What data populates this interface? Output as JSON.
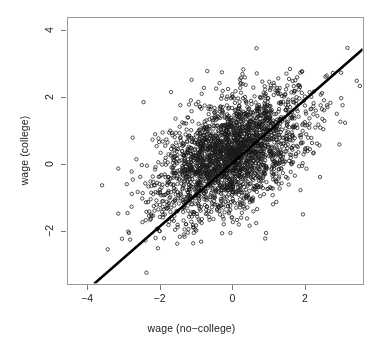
{
  "chart_data": {
    "type": "scatter",
    "title": "",
    "xlabel": "wage (no−college)",
    "ylabel": "wage (college)",
    "xlim": [
      -4.55,
      3.6
    ],
    "ylim": [
      -3.6,
      4.4
    ],
    "xticks": [
      -4,
      -2,
      0,
      2
    ],
    "xtick_labels": [
      "−4",
      "−2",
      "0",
      "2"
    ],
    "yticks": [
      -2,
      0,
      2,
      4
    ],
    "ytick_labels": [
      "−2",
      "0",
      "2",
      "4"
    ],
    "grid": false,
    "legend": null,
    "point_marker": "open-circle",
    "point_color": "#1a1a1a",
    "point_radius_px": 1.7,
    "n_points": 2500,
    "distribution": {
      "kind": "bivariate-normal",
      "mean_x": -0.05,
      "mean_y": 0.3,
      "sd_x": 1.02,
      "sd_y": 0.95,
      "correlation": 0.5
    },
    "reference_line": {
      "kind": "identity-line",
      "slope": 0.95,
      "intercept": 0.02,
      "x_start": -3.8,
      "x_end": 3.6,
      "color": "#000000",
      "width_px": 2.6
    },
    "box_color": "#9a9a9a",
    "tick_color": "#7a7a7a",
    "background": "#ffffff",
    "annotations": []
  },
  "figure": {
    "width": 383,
    "height": 349,
    "plot_box": {
      "left": 67,
      "top": 17,
      "right": 363,
      "bottom": 284
    }
  }
}
